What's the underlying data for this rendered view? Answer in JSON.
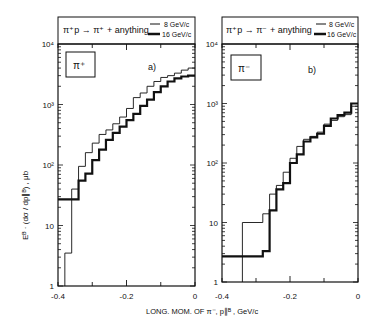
{
  "chart_data": [
    {
      "type": "line",
      "panel": "a)",
      "title": "π⁺p → π⁺ + anything",
      "particle_label": "π⁺",
      "xlabel": "LONG. MOM. OF π⁻, p∥ᴮ , GeV/c",
      "ylabel": "Eᴮ · (dσ / dp∥ᴮ) , μb",
      "xlim": [
        -0.4,
        0
      ],
      "ylim": [
        1,
        10000
      ],
      "yscale": "log",
      "x_ticks": [
        "-0.4",
        "-0.2",
        "0"
      ],
      "y_ticks": [
        "1",
        "10",
        "10²",
        "10³",
        "10⁴"
      ],
      "legend": [
        "8 GeV/c",
        "16 GeV/c"
      ],
      "bin_edges": [
        -0.38,
        -0.36,
        -0.34,
        -0.32,
        -0.3,
        -0.28,
        -0.26,
        -0.24,
        -0.22,
        -0.2,
        -0.18,
        -0.16,
        -0.14,
        -0.12,
        -0.1,
        -0.08,
        -0.06,
        -0.04,
        -0.02,
        0.0
      ],
      "series": [
        {
          "name": "8 GeV/c",
          "style": "thin",
          "values": [
            3.5,
            40,
            95,
            160,
            230,
            320,
            380,
            480,
            620,
            860,
            1300,
            1550,
            2000,
            2400,
            2800,
            3000,
            3300,
            3700,
            4000
          ]
        },
        {
          "name": "16 GeV/c",
          "style": "thick",
          "values": [
            27,
            27,
            55,
            72,
            120,
            180,
            260,
            340,
            430,
            550,
            700,
            950,
            1200,
            1600,
            2000,
            2400,
            2700,
            2900,
            3000
          ]
        }
      ],
      "pre_bin": {
        "x": [
          -0.4,
          -0.38
        ],
        "16 GeV/c": 27
      }
    },
    {
      "type": "line",
      "panel": "b)",
      "title": "π⁺p → π⁻ + anything",
      "particle_label": "π⁻",
      "xlabel": "LONG. MOM. OF π⁻, p∥ᴮ , GeV/c",
      "xlim": [
        -0.4,
        0
      ],
      "ylim": [
        1,
        10000
      ],
      "yscale": "log",
      "x_ticks": [
        "-0.4",
        "-0.2",
        "0"
      ],
      "y_ticks": [
        "1",
        "10",
        "10²",
        "10³",
        "10⁴"
      ],
      "legend": [
        "8 GeV/c",
        "16 GeV/c"
      ],
      "bin_edges": [
        -0.34,
        -0.3,
        -0.28,
        -0.26,
        -0.24,
        -0.22,
        -0.2,
        -0.18,
        -0.16,
        -0.14,
        -0.12,
        -0.1,
        -0.08,
        -0.06,
        -0.04,
        -0.02,
        0.0
      ],
      "series": [
        {
          "name": "8 GeV/c",
          "style": "thin",
          "values": [
            10,
            10,
            14,
            30,
            42,
            70,
            120,
            190,
            250,
            280,
            330,
            450,
            520,
            600,
            650,
            900
          ]
        },
        {
          "name": "16 GeV/c",
          "style": "thick",
          "values": [
            2.7,
            2.7,
            3.3,
            16,
            36,
            46,
            100,
            140,
            230,
            270,
            310,
            420,
            560,
            640,
            700,
            1000
          ]
        }
      ],
      "pre_bin": {
        "x": [
          -0.4,
          -0.34
        ],
        "16 GeV/c": 2.7
      }
    }
  ],
  "labels": {
    "panel_a_title": "π⁺p → π⁺ + anything",
    "panel_b_title": "π⁺p → π⁻ + anything",
    "legend_8": "8 GeV/c",
    "legend_16": "16 GeV/c",
    "panel_a_id": "a)",
    "panel_b_id": "b)",
    "particle_a": "π⁺",
    "particle_b": "π⁻",
    "xlabel": "LONG. MOM. OF π⁻, p∥ᴮ , GeV/c",
    "ylabel": "Eᴮ · (dσ / dp∥ᴮ) , μb"
  }
}
